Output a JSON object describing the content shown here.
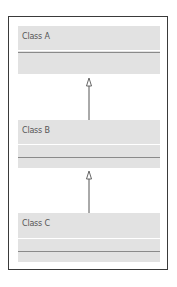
{
  "diagram": {
    "type": "uml-class-inheritance",
    "classes": [
      {
        "name": "Class A"
      },
      {
        "name": "Class B"
      },
      {
        "name": "Class C"
      }
    ],
    "relations": [
      {
        "from": "Class B",
        "to": "Class A",
        "kind": "generalization"
      },
      {
        "from": "Class C",
        "to": "Class B",
        "kind": "generalization"
      }
    ],
    "colors": {
      "frame": "#3a3a3a",
      "class_fill": "#e2e2e2",
      "separator": "#8a8a8a",
      "text": "#555555"
    }
  }
}
